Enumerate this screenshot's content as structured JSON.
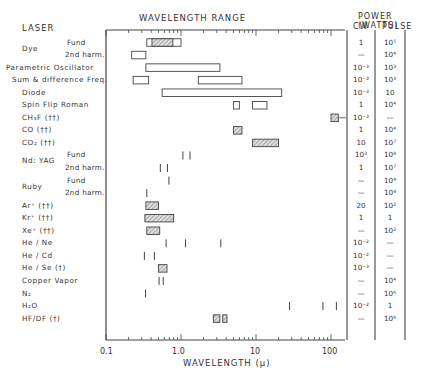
{
  "headers": {
    "laser": "LASER",
    "wavelength_range": "WAVELENGTH RANGE",
    "power": "POWER (WATTS)",
    "cw": "CW",
    "pulse": "PULSE"
  },
  "axis": {
    "xlabel": "WAVELENGTH (μ)",
    "ticks": [
      "0.1",
      "1.0",
      "10",
      "100"
    ]
  },
  "rows": [
    {
      "group": "Dye",
      "label": "",
      "sub": "Fund",
      "cw": "1",
      "pulse": "10⁵"
    },
    {
      "group": "",
      "label": "",
      "sub": "2nd harm.",
      "cw": "—",
      "pulse": "10⁴"
    },
    {
      "group": "",
      "label": "Parametric Oscillator",
      "sub": "",
      "cw": "10⁻³",
      "pulse": "10³"
    },
    {
      "group": "",
      "label": "Sum & difference Freq.",
      "sub": "",
      "cw": "10⁻³",
      "pulse": "10³"
    },
    {
      "group": "",
      "label": "Diode",
      "sub": "",
      "cw": "10⁻³",
      "pulse": "10"
    },
    {
      "group": "",
      "label": "Spin Flip Roman",
      "sub": "",
      "cw": "1",
      "pulse": "10⁴"
    },
    {
      "group": "",
      "label": "CH₃F (††)",
      "sub": "",
      "cw": "10⁻³",
      "pulse": "—"
    },
    {
      "group": "",
      "label": "CO (††)",
      "sub": "",
      "cw": "1",
      "pulse": "10⁴"
    },
    {
      "group": "",
      "label": "CO₂ (††)",
      "sub": "",
      "cw": "10",
      "pulse": "10⁷"
    },
    {
      "group": "Nd: YAG",
      "label": "",
      "sub": "Fund",
      "cw": "10³",
      "pulse": "10⁸"
    },
    {
      "group": "",
      "label": "",
      "sub": "2nd harm.",
      "cw": "1",
      "pulse": "10⁷"
    },
    {
      "group": "Ruby",
      "label": "",
      "sub": "Fund",
      "cw": "—",
      "pulse": "10⁹"
    },
    {
      "group": "",
      "label": "",
      "sub": "2nd harm.",
      "cw": "—",
      "pulse": "10⁸"
    },
    {
      "group": "",
      "label": "Ar⁺ (††)",
      "sub": "",
      "cw": "20",
      "pulse": "10²"
    },
    {
      "group": "",
      "label": "Kr⁺ (††)",
      "sub": "",
      "cw": "1",
      "pulse": "1"
    },
    {
      "group": "",
      "label": "Xe⁺ (††)",
      "sub": "",
      "cw": "—",
      "pulse": "10²"
    },
    {
      "group": "",
      "label": "He / Ne",
      "sub": "",
      "cw": "10⁻²",
      "pulse": "—"
    },
    {
      "group": "",
      "label": "He / Cd",
      "sub": "",
      "cw": "10⁻²",
      "pulse": "—"
    },
    {
      "group": "",
      "label": "He / Se (†)",
      "sub": "",
      "cw": "10⁻³",
      "pulse": "—"
    },
    {
      "group": "",
      "label": "Copper Vapor",
      "sub": "",
      "cw": "—",
      "pulse": "10⁴"
    },
    {
      "group": "",
      "label": "N₂",
      "sub": "",
      "cw": "—",
      "pulse": "10⁶"
    },
    {
      "group": "",
      "label": "H₂O",
      "sub": "",
      "cw": "10⁻²",
      "pulse": "1"
    },
    {
      "group": "",
      "label": "HF/DF (†)",
      "sub": "",
      "cw": "—",
      "pulse": "10⁶"
    }
  ],
  "chart_data": {
    "type": "range-bar",
    "title": "",
    "xlabel": "WAVELENGTH (μ)",
    "xscale": "log",
    "xlim": [
      0.1,
      150
    ],
    "x_ticks": [
      0.1,
      1.0,
      10,
      100
    ],
    "columns": [
      "LASER",
      "WAVELENGTH RANGE",
      "POWER CW (W)",
      "POWER PULSE (W)"
    ],
    "series": [
      {
        "name": "Dye Fund",
        "ranges": [
          [
            0.35,
            1.0
          ]
        ],
        "hatched_ranges": [
          [
            0.41,
            0.78
          ]
        ],
        "cw": "1",
        "pulse": "1e5"
      },
      {
        "name": "Dye 2nd harm.",
        "ranges": [
          [
            0.22,
            0.34
          ]
        ],
        "cw": "-",
        "pulse": "1e4"
      },
      {
        "name": "Parametric Oscillator",
        "ranges": [
          [
            0.34,
            3.3
          ]
        ],
        "cw": "1e-3",
        "pulse": "1e3"
      },
      {
        "name": "Sum & difference Freq.",
        "ranges": [
          [
            0.23,
            0.37
          ],
          [
            1.7,
            6.5
          ]
        ],
        "cw": "1e-3",
        "pulse": "1e3"
      },
      {
        "name": "Diode",
        "ranges": [
          [
            0.56,
            22
          ]
        ],
        "cw": "1e-3",
        "pulse": "10"
      },
      {
        "name": "Spin Flip Raman",
        "ranges": [
          [
            5.0,
            6.0
          ],
          [
            9.0,
            14.0
          ]
        ],
        "cw": "1",
        "pulse": "1e4"
      },
      {
        "name": "CH3F",
        "hatched_ranges": [
          [
            100,
            125
          ]
        ],
        "cw": "1e-3",
        "pulse": "-"
      },
      {
        "name": "CO",
        "hatched_ranges": [
          [
            5.0,
            6.5
          ]
        ],
        "cw": "1",
        "pulse": "1e4"
      },
      {
        "name": "CO2",
        "hatched_ranges": [
          [
            9.0,
            20.0
          ]
        ],
        "cw": "10",
        "pulse": "1e7"
      },
      {
        "name": "Nd:YAG Fund",
        "lines": [
          1.06,
          1.32
        ],
        "cw": "1e3",
        "pulse": "1e8"
      },
      {
        "name": "Nd:YAG 2nd harm.",
        "lines": [
          0.53,
          0.66
        ],
        "cw": "1",
        "pulse": "1e7"
      },
      {
        "name": "Ruby Fund",
        "lines": [
          0.69
        ],
        "cw": "-",
        "pulse": "1e9"
      },
      {
        "name": "Ruby 2nd harm.",
        "lines": [
          0.35
        ],
        "cw": "-",
        "pulse": "1e8"
      },
      {
        "name": "Ar+",
        "hatched_ranges": [
          [
            0.34,
            0.5
          ]
        ],
        "cw": "20",
        "pulse": "1e2"
      },
      {
        "name": "Kr+",
        "hatched_ranges": [
          [
            0.33,
            0.8
          ]
        ],
        "cw": "1",
        "pulse": "1"
      },
      {
        "name": "Xe+",
        "hatched_ranges": [
          [
            0.35,
            0.52
          ]
        ],
        "cw": "-",
        "pulse": "1e2"
      },
      {
        "name": "He/Ne",
        "lines": [
          0.633,
          1.15,
          3.39
        ],
        "cw": "1e-2",
        "pulse": "-"
      },
      {
        "name": "He/Cd",
        "lines": [
          0.325,
          0.442
        ],
        "cw": "1e-2",
        "pulse": "-"
      },
      {
        "name": "He/Se",
        "hatched_ranges": [
          [
            0.5,
            0.65
          ]
        ],
        "cw": "1e-3",
        "pulse": "-"
      },
      {
        "name": "Copper Vapor",
        "lines": [
          0.51,
          0.58
        ],
        "cw": "-",
        "pulse": "1e4"
      },
      {
        "name": "N2",
        "lines": [
          0.337
        ],
        "cw": "-",
        "pulse": "1e6"
      },
      {
        "name": "H2O",
        "lines": [
          28,
          78,
          118
        ],
        "cw": "1e-2",
        "pulse": "1"
      },
      {
        "name": "HF/DF",
        "hatched_ranges": [
          [
            2.7,
            3.3
          ],
          [
            3.6,
            4.1
          ]
        ],
        "cw": "-",
        "pulse": "1e6"
      }
    ]
  }
}
